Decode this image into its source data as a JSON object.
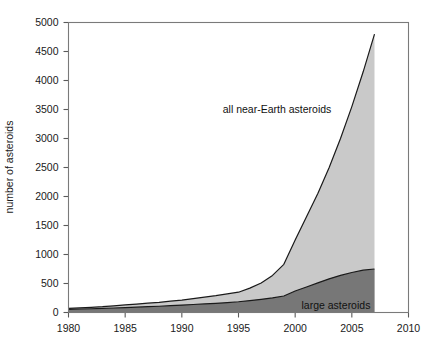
{
  "chart_data": {
    "type": "area",
    "title": "",
    "subtitle": "",
    "xlabel": "",
    "ylabel": "number of asteroids",
    "xlim": [
      1980,
      2010
    ],
    "ylim": [
      0,
      5000
    ],
    "grid": false,
    "stacked": false,
    "legend_position": "inline-annotations",
    "x_ticks": [
      "1980",
      "1985",
      "1990",
      "1995",
      "2000",
      "2005",
      "2010"
    ],
    "x_tick_values": [
      1980,
      1985,
      1990,
      1995,
      2000,
      2005,
      2010
    ],
    "y_ticks": [
      "0",
      "500",
      "1000",
      "1500",
      "2000",
      "2500",
      "3000",
      "3500",
      "4000",
      "4500",
      "5000"
    ],
    "y_tick_values": [
      0,
      500,
      1000,
      1500,
      2000,
      2500,
      3000,
      3500,
      4000,
      4500,
      5000
    ],
    "x": [
      1980,
      1981,
      1982,
      1983,
      1984,
      1985,
      1986,
      1987,
      1988,
      1989,
      1990,
      1991,
      1992,
      1993,
      1994,
      1995,
      1996,
      1997,
      1998,
      1999,
      2000,
      2001,
      2002,
      2003,
      2004,
      2005,
      2006,
      2007
    ],
    "series": [
      {
        "name": "all near-Earth asteroids",
        "fill_color": "#c9c9c9",
        "line_color": "#1a1a1a",
        "values": [
          70,
          80,
          90,
          100,
          115,
          130,
          145,
          160,
          175,
          195,
          215,
          240,
          265,
          290,
          320,
          350,
          420,
          510,
          640,
          830,
          1250,
          1650,
          2050,
          2500,
          3000,
          3550,
          4150,
          4800
        ]
      },
      {
        "name": "large asteroids",
        "fill_color": "#777777",
        "line_color": "#1a1a1a",
        "values": [
          55,
          60,
          65,
          70,
          78,
          85,
          92,
          100,
          108,
          118,
          128,
          138,
          148,
          158,
          170,
          185,
          205,
          228,
          252,
          285,
          370,
          440,
          510,
          580,
          640,
          690,
          730,
          750
        ]
      }
    ],
    "annotations": [
      {
        "text": "all near-Earth asteroids",
        "x": 1998.4,
        "y": 3500,
        "anchor": "middle"
      },
      {
        "text": "large asteroids",
        "x": 2003.6,
        "y": 130,
        "anchor": "middle"
      }
    ]
  }
}
